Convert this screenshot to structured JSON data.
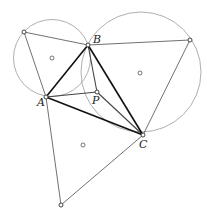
{
  "diagram": {
    "colors": {
      "background": "#ffffff",
      "circle": "#b0b0b0",
      "thin_line": "#333333",
      "thick_line": "#111111",
      "medium_line": "#444444",
      "point_fill": "#ffffff",
      "point_stroke": "#333333"
    },
    "points": {
      "A": {
        "label": "A",
        "x": 46,
        "y": 97,
        "label_x": 37,
        "label_y": 106
      },
      "B": {
        "label": "B",
        "x": 88,
        "y": 45,
        "label_x": 93,
        "label_y": 43
      },
      "C": {
        "label": "C",
        "x": 143,
        "y": 135,
        "label_x": 139,
        "label_y": 148
      },
      "P": {
        "label": "P",
        "x": 97,
        "y": 92,
        "label_x": 92,
        "label_y": 104
      },
      "E_AB": {
        "label": "",
        "x": 24,
        "y": 32
      },
      "E_BC": {
        "label": "",
        "x": 190,
        "y": 40
      },
      "E_CA": {
        "label": "",
        "x": 61,
        "y": 205
      }
    },
    "centers": [
      {
        "name": "center-abe",
        "x": 52,
        "y": 58
      },
      {
        "name": "center-bce",
        "x": 140,
        "y": 73
      },
      {
        "name": "center-cae",
        "x": 83,
        "y": 145
      }
    ],
    "circles": [
      {
        "name": "circumcircle-abe",
        "cx": 52,
        "cy": 58,
        "r": 38.5
      },
      {
        "name": "circumcircle-bce",
        "cx": 141,
        "cy": 72,
        "r": 60
      }
    ],
    "labels": {
      "A": "A",
      "B": "B",
      "C": "C",
      "P": "P"
    }
  }
}
